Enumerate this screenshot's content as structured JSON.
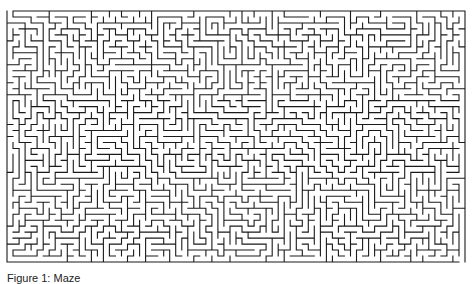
{
  "figure": {
    "type": "maze",
    "line_color": "#1a1a1a",
    "background": "#ffffff",
    "grid": {
      "cols": 76,
      "rows": 42
    },
    "entrance": "top-left",
    "exit": "bottom-right",
    "seed": 1337
  },
  "caption": {
    "text": "Figure 1: Maze"
  }
}
